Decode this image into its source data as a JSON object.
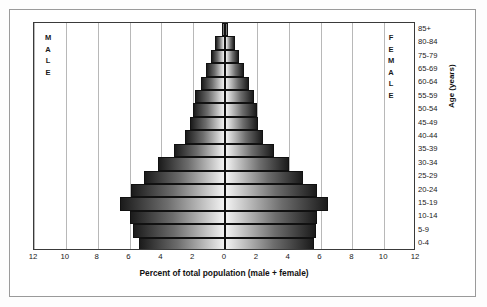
{
  "chart_data": {
    "type": "bar",
    "title": "",
    "subtitle": "",
    "xlabel": "Percent of total population (male + female)",
    "ylabel": "Age (years)",
    "orientation": "horizontal-diverging",
    "grid": true,
    "legend_position": "in-plot",
    "xlim": [
      -12,
      12
    ],
    "xticks": [
      12,
      10,
      8,
      6,
      4,
      2,
      0,
      2,
      4,
      6,
      8,
      10,
      12
    ],
    "xtick_values": [
      -12,
      -10,
      -8,
      -6,
      -4,
      -2,
      0,
      2,
      4,
      6,
      8,
      10,
      12
    ],
    "categories": [
      "0-4",
      "5-9",
      "10-14",
      "15-19",
      "20-24",
      "25-29",
      "30-34",
      "35-39",
      "40-44",
      "45-49",
      "50-54",
      "55-59",
      "60-64",
      "65-69",
      "75-79",
      "80-84",
      "85+"
    ],
    "axis_labels_top_to_bottom": [
      "85+",
      "80-84",
      "75-79",
      "65-69",
      "60-64",
      "55-59",
      "50-54",
      "45-49",
      "40-44",
      "35-39",
      "30-34",
      "25-29",
      "20-24",
      "15-19",
      "10-14",
      "5-9",
      "0-4"
    ],
    "series": [
      {
        "name": "MALE",
        "side": "left",
        "values": [
          5.4,
          5.8,
          6.0,
          6.6,
          5.9,
          5.1,
          4.2,
          3.2,
          2.5,
          2.2,
          2.0,
          1.9,
          1.5,
          1.2,
          0.9,
          0.6,
          0.2
        ]
      },
      {
        "name": "FEMALE",
        "side": "right",
        "values": [
          5.6,
          5.7,
          5.8,
          6.5,
          5.8,
          4.9,
          4.0,
          3.1,
          2.4,
          2.1,
          2.0,
          1.8,
          1.5,
          1.2,
          0.9,
          0.6,
          0.2
        ]
      }
    ]
  },
  "labels": {
    "male": "MALE",
    "female": "FEMALE",
    "male_letters": [
      "M",
      "A",
      "L",
      "E"
    ],
    "female_letters": [
      "F",
      "E",
      "M",
      "A",
      "L",
      "E"
    ],
    "x_axis_title": "Percent of total population (male + female)",
    "y_axis_title": "Age (years)"
  },
  "colors": {
    "bar_dark": "#1b1b1b",
    "bar_light": "#f2f2f2",
    "bar_outline": "#111111",
    "gridline": "#b8b8b8",
    "center_axis": "#7d7d7d",
    "plot_border": "#3a3a3a",
    "outer_frame": "#9a9a9a",
    "background": "#ffffff",
    "text": "#1a1a1a"
  }
}
